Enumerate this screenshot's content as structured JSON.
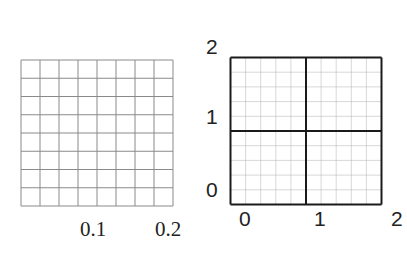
{
  "left_grid": {
    "columns": 8,
    "rows": 8,
    "line_color": "#8a8a8a",
    "x_labels": [
      {
        "text": "0.1",
        "x": 80,
        "y": 219
      },
      {
        "text": "0.2",
        "x": 155,
        "y": 219
      }
    ]
  },
  "right_grid": {
    "columns": 10,
    "rows": 10,
    "major_divisions": 2,
    "minor_color": "#b0b0b0",
    "major_color": "#1a1a1a",
    "x_labels": [
      {
        "text": "0",
        "x": 239,
        "y": 208
      },
      {
        "text": "1",
        "x": 314,
        "y": 208
      },
      {
        "text": "2",
        "x": 391,
        "y": 208
      }
    ],
    "y_labels": [
      {
        "text": "2",
        "x": 206,
        "y": 36
      },
      {
        "text": "1",
        "x": 206,
        "y": 106
      },
      {
        "text": "0",
        "x": 206,
        "y": 179
      }
    ]
  }
}
